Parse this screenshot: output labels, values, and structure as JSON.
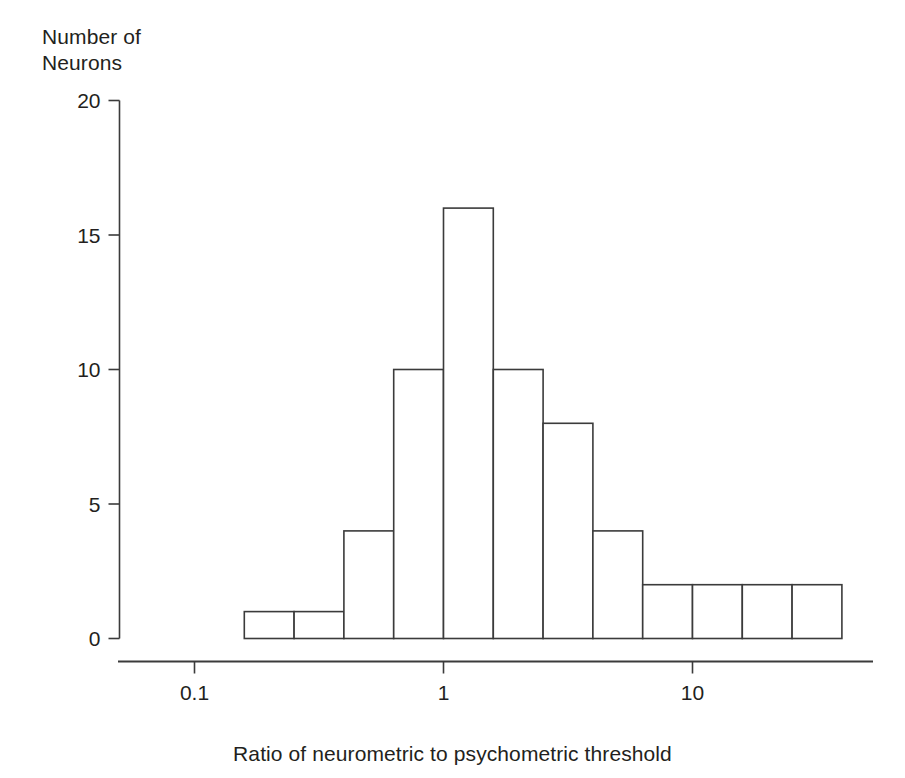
{
  "chart_data": {
    "type": "bar",
    "title": "",
    "subtitle": "",
    "xlabel": "Ratio of neurometric to psychometric threshold",
    "ylabel": "Number of\nNeurons",
    "ylabel_lines": [
      "Number of",
      "Neurons"
    ],
    "xscale": "log",
    "yscale": "linear",
    "xlim": [
      0.1,
      50
    ],
    "ylim": [
      0,
      20
    ],
    "xticks": [
      0.1,
      1,
      10
    ],
    "xtick_labels": [
      "0.1",
      "1",
      "10"
    ],
    "yticks": [
      0,
      5,
      10,
      15,
      20
    ],
    "ytick_labels": [
      "0",
      "5",
      "10",
      "15",
      "20"
    ],
    "grid": false,
    "legend": false,
    "legend_position": "none",
    "bin_edges_log10": [
      -0.8,
      -0.6,
      -0.4,
      -0.2,
      0.0,
      0.2,
      0.4,
      0.6,
      0.8,
      1.0,
      1.2,
      1.4,
      1.6
    ],
    "bin_edges": [
      0.158,
      0.251,
      0.398,
      0.631,
      1.0,
      1.585,
      2.512,
      3.981,
      6.31,
      10.0,
      15.85,
      25.12,
      39.81
    ],
    "categories": [
      "0.126-0.158",
      "0.158-0.251",
      "0.251-0.398",
      "0.398-0.631",
      "0.631-1.0",
      "1.0-1.585",
      "1.585-2.512",
      "2.512-3.981",
      "6.31-10.0",
      "10.0-15.85",
      "15.85-25.12",
      "25.12-39.81"
    ],
    "values": [
      1,
      1,
      4,
      10,
      16,
      10,
      8,
      4,
      2,
      2,
      2,
      2
    ],
    "bar_fill": "#ffffff",
    "bar_stroke": "#3b3b3b",
    "axis_color": "#3b3b3b",
    "text_color": "#231f20",
    "total_neurons": 62
  }
}
